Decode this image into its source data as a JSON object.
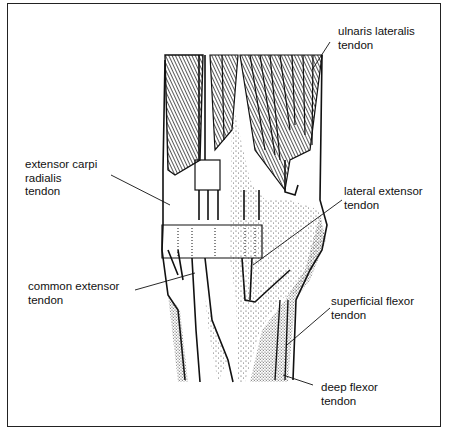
{
  "diagram": {
    "labels": [
      {
        "id": "ulnaris",
        "lines": [
          "ulnaris lateralis",
          "tendon"
        ]
      },
      {
        "id": "ecr",
        "lines": [
          "extensor carpi",
          "radialis",
          "tendon"
        ]
      },
      {
        "id": "lateral",
        "lines": [
          "lateral extensor",
          "tendon"
        ]
      },
      {
        "id": "common",
        "lines": [
          "common extensor",
          "tendon"
        ]
      },
      {
        "id": "superficial",
        "lines": [
          "superficial flexor",
          "tendon"
        ]
      },
      {
        "id": "deep",
        "lines": [
          "deep flexor",
          "tendon"
        ]
      }
    ]
  }
}
